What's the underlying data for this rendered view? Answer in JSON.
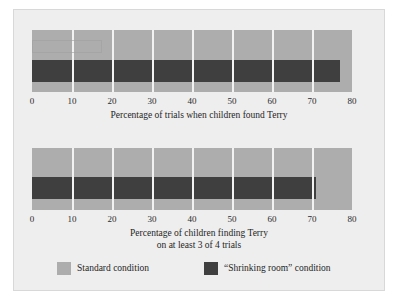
{
  "figure": {
    "background_color": "#eeeeee",
    "border_color": "#d8d8d8"
  },
  "colors": {
    "standard": "#adadad",
    "shrinking": "#3f3f3f",
    "gridline": "#f2f2f2",
    "text": "#1f1f1f"
  },
  "legend": {
    "items": [
      {
        "label": "Standard condition",
        "color": "#adadad",
        "swatch_name": "legend-swatch-standard"
      },
      {
        "label": "“Shrinking room” condition",
        "color": "#3f3f3f",
        "swatch_name": "legend-swatch-shrinking"
      }
    ]
  },
  "axis": {
    "ticks": [
      "0",
      "10",
      "20",
      "30",
      "40",
      "50",
      "60",
      "70",
      "80"
    ],
    "min": 0,
    "max": 80
  },
  "charts": [
    {
      "id": "chart-trials-found-terry",
      "title_line1": "Percentage of trials when children found Terry",
      "title_line2": "",
      "standard_value": 80,
      "shrinking_value": 77
    },
    {
      "id": "chart-children-3-of-4",
      "title_line1": "Percentage of children finding Terry",
      "title_line2": "on at least 3 of 4 trials",
      "standard_value": 80,
      "shrinking_value": 71
    }
  ],
  "chart_data": {
    "type": "bar",
    "orientation": "horizontal",
    "title": "",
    "subtitle": "",
    "xlabel": "",
    "ylabel": "",
    "xlim": [
      0,
      80
    ],
    "grid": true,
    "legend_position": "bottom",
    "xticks": [
      0,
      10,
      20,
      30,
      40,
      50,
      60,
      70,
      80
    ],
    "panels": [
      {
        "xlabel": "Percentage of trials when children found Terry",
        "categories": [
          "Standard condition",
          "“Shrinking room” condition"
        ],
        "values": [
          80,
          77
        ]
      },
      {
        "xlabel": "Percentage of children finding Terry on at least 3 of 4 trials",
        "categories": [
          "Standard condition",
          "“Shrinking room” condition"
        ],
        "values": [
          80,
          71
        ]
      }
    ],
    "series": [
      {
        "name": "Standard condition",
        "values": [
          80,
          80
        ],
        "color": "#adadad"
      },
      {
        "name": "“Shrinking room” condition",
        "values": [
          77,
          71
        ],
        "color": "#3f3f3f"
      }
    ],
    "panel_labels": [
      "Percentage of trials when children found Terry",
      "Percentage of children finding Terry on at least 3 of 4 trials"
    ]
  }
}
